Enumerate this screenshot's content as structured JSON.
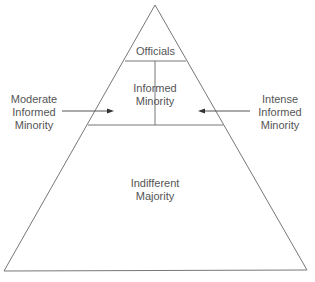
{
  "diagram": {
    "type": "pyramid",
    "levels": [
      {
        "label_lines": [
          "Officials"
        ]
      },
      {
        "label_lines": [
          "Informed",
          "Minority"
        ]
      },
      {
        "label_lines": [
          "Indifferent",
          "Majority"
        ]
      }
    ],
    "side_labels": {
      "left": [
        "Moderate",
        "Informed",
        "Minority"
      ],
      "right": [
        "Intense",
        "Informed",
        "Minority"
      ]
    }
  }
}
